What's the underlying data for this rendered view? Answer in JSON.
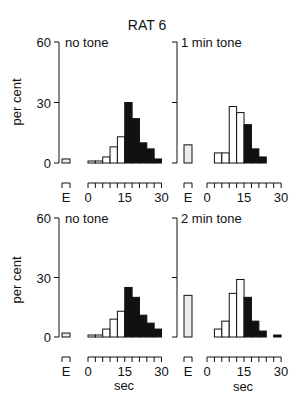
{
  "figure": {
    "title": "RAT 6",
    "ylabel": "per cent",
    "xlabel": "sec",
    "e_label": "E",
    "y_ticks": [
      "0",
      "30",
      "60"
    ],
    "x_ticks": [
      "0",
      "15",
      "30"
    ]
  },
  "colors": {
    "ink": "#111111",
    "background": "#ffffff",
    "e_bar_fill": "#ececec"
  },
  "chart_data": [
    {
      "type": "bar",
      "title": "no tone",
      "figure_title": "RAT 6",
      "xlabel": "",
      "ylabel": "per cent",
      "ylim": [
        0,
        60
      ],
      "xlim": [
        0,
        30
      ],
      "bin_width_sec": 3,
      "categories": [
        "E",
        "0-3",
        "3-6",
        "6-9",
        "9-12",
        "12-15",
        "15-18",
        "18-21",
        "21-24",
        "24-27",
        "27-30"
      ],
      "values": [
        2,
        1,
        1,
        3,
        8,
        13,
        30,
        22,
        10,
        7,
        2
      ],
      "fill": [
        "stipple",
        "white",
        "white",
        "white",
        "white",
        "white",
        "black",
        "black",
        "black",
        "black",
        "black"
      ]
    },
    {
      "type": "bar",
      "title": "1 min tone",
      "figure_title": "RAT 6",
      "xlabel": "",
      "ylabel": "",
      "ylim": [
        0,
        60
      ],
      "xlim": [
        0,
        30
      ],
      "bin_width_sec": 3,
      "categories": [
        "E",
        "0-3",
        "3-6",
        "6-9",
        "9-12",
        "12-15",
        "15-18",
        "18-21",
        "21-24",
        "24-27",
        "27-30"
      ],
      "values": [
        9,
        0,
        5,
        5,
        28,
        25,
        19,
        7,
        3,
        0,
        0
      ],
      "fill": [
        "stipple",
        "white",
        "white",
        "white",
        "white",
        "white",
        "black",
        "black",
        "black",
        "black",
        "black"
      ]
    },
    {
      "type": "bar",
      "title": "no tone",
      "xlabel": "sec",
      "ylabel": "per cent",
      "ylim": [
        0,
        60
      ],
      "xlim": [
        0,
        30
      ],
      "bin_width_sec": 3,
      "categories": [
        "E",
        "0-3",
        "3-6",
        "6-9",
        "9-12",
        "12-15",
        "15-18",
        "18-21",
        "21-24",
        "24-27",
        "27-30"
      ],
      "values": [
        2,
        1,
        1,
        4,
        9,
        13,
        25,
        20,
        11,
        7,
        4
      ],
      "fill": [
        "stipple",
        "white",
        "white",
        "white",
        "white",
        "white",
        "black",
        "black",
        "black",
        "black",
        "black"
      ]
    },
    {
      "type": "bar",
      "title": "2 min tone",
      "xlabel": "sec",
      "ylabel": "",
      "ylim": [
        0,
        60
      ],
      "xlim": [
        0,
        30
      ],
      "bin_width_sec": 3,
      "categories": [
        "E",
        "0-3",
        "3-6",
        "6-9",
        "9-12",
        "12-15",
        "15-18",
        "18-21",
        "21-24",
        "24-27",
        "27-30"
      ],
      "values": [
        21,
        0,
        4,
        8,
        22,
        29,
        20,
        8,
        3,
        0,
        1
      ],
      "fill": [
        "stipple",
        "white",
        "white",
        "white",
        "white",
        "white",
        "black",
        "black",
        "black",
        "black",
        "black"
      ]
    }
  ]
}
